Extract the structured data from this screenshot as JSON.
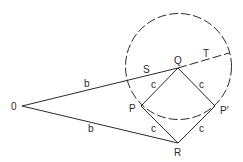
{
  "diagram": {
    "type": "geometry",
    "colors": {
      "stroke": "#2a2a2a",
      "background": "#ffffff"
    },
    "points": {
      "O": {
        "label": "0",
        "x": 22,
        "y": 106
      },
      "Q": {
        "label": "Q",
        "x": 178,
        "y": 68
      },
      "P": {
        "label": "P",
        "x": 141,
        "y": 106
      },
      "P_prime": {
        "label": "P′",
        "x": 215,
        "y": 106
      },
      "R": {
        "label": "R",
        "x": 178,
        "y": 143
      }
    },
    "circle": {
      "cx": 178.5,
      "cy": 66.5,
      "r": 53,
      "style": "dashed"
    },
    "segment_labels": {
      "OQ": "b",
      "OR": "b",
      "QP": "c",
      "QP_prime": "c",
      "PR": "c",
      "P_primeR": "c"
    },
    "line_labels": {
      "S": "S",
      "T": "T"
    }
  }
}
